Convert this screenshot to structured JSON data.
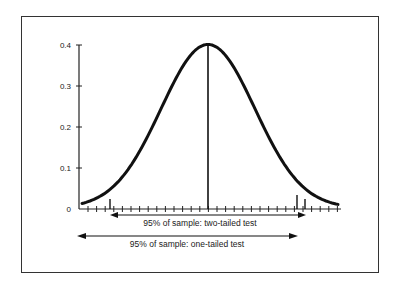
{
  "chart_data": {
    "type": "line",
    "title": "",
    "xlabel": "",
    "ylabel": "",
    "ylim": [
      0,
      0.4
    ],
    "yticks": [
      "0",
      "0.1",
      "0.2",
      "0.3",
      "0.4"
    ],
    "grid": false,
    "series": [
      {
        "name": "Normal distribution density",
        "description": "Bell curve peaking at ~0.4 at the mean",
        "peak": 0.4
      }
    ],
    "markers": [
      {
        "name": "mean",
        "label": ""
      },
      {
        "name": "lower-critical-two-tailed",
        "label": ""
      },
      {
        "name": "upper-critical-one-tailed",
        "label": ""
      },
      {
        "name": "upper-critical-two-tailed",
        "label": ""
      }
    ],
    "annotations": [
      {
        "id": "two_tailed",
        "text": "95% of sample: two-tailed test",
        "arrow": "double"
      },
      {
        "id": "one_tailed",
        "text": "95% of sample: one-tailed test",
        "arrow": "double"
      }
    ]
  },
  "labels": {
    "y0": "0",
    "y1": "0.1",
    "y2": "0.2",
    "y3": "0.3",
    "y4": "0.4",
    "two_tailed": "95% of sample: two-tailed test",
    "one_tailed": "95% of sample: one-tailed test"
  }
}
